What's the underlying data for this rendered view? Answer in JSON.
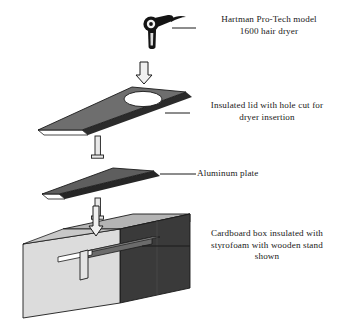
{
  "figure": {
    "background_color": "#ffffff",
    "line_color": "#1a1a1a",
    "text_color": "#181818"
  },
  "callouts": [
    {
      "id": "dryer",
      "text": "Hartman Pro-Tech model\n1600 hair dryer",
      "lines": [
        "Hartman Pro-Tech model",
        "1600 hair dryer"
      ]
    },
    {
      "id": "lid",
      "text": "Insulated lid with hole cut for\ndryer insertion",
      "lines": [
        "Insulated lid with hole cut for",
        "dryer insertion"
      ]
    },
    {
      "id": "plate",
      "text": "Aluminum plate",
      "lines": [
        "Aluminum plate"
      ]
    },
    {
      "id": "box",
      "text": "Cardboard box insulated with\nstyrofoam with wooden stand\nshown",
      "lines": [
        "Cardboard box insulated with",
        "styrofoam with wooden stand",
        "shown"
      ]
    }
  ],
  "parts": {
    "hair_dryer": {
      "name": "Hartman Pro-Tech model 1600 hair dryer",
      "fill": "#141414",
      "detail_fill": "#f2f2f2"
    },
    "insulated_lid": {
      "name": "Insulated lid with hole cut for dryer insertion",
      "top_fill": "#6e6e6e",
      "edge_fill": "#2b2b2b",
      "underside_fill": "#ffffff",
      "hole_fill": "#ffffff"
    },
    "aluminum_plate": {
      "name": "Aluminum plate",
      "top_fill": "#5e5e5e",
      "edge_fill": "#262626",
      "underside_fill": "#ffffff"
    },
    "cardboard_box": {
      "name": "Cardboard box insulated with styrofoam with wooden stand shown",
      "front_fill": "#dcdcdc",
      "top_fill": "#b4b4b4",
      "side_fill": "#3a3a3a",
      "interior_shelf_fill": "#6b6b6b"
    },
    "assembly_arrows": {
      "name": "downward assembly arrows",
      "count": 3,
      "fill": "#f0f0f0",
      "stroke": "#1a1a1a"
    },
    "alignment_rods": {
      "name": "vertical alignment rods",
      "count": 2,
      "fill": "#e8e8e8",
      "stroke": "#1a1a1a"
    }
  }
}
